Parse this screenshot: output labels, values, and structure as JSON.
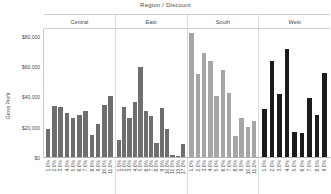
{
  "chart_data": {
    "type": "bar",
    "title": "Region / Discount",
    "xlabel": "",
    "ylabel": "Gross Profit",
    "ylim": [
      0,
      85000
    ],
    "grid": false,
    "legend": "none",
    "y_ticks": [
      "$0",
      "$20,000",
      "$40,000",
      "$60,000",
      "$80,000"
    ],
    "y_tick_values": [
      0,
      20000,
      40000,
      60000,
      80000
    ],
    "panel_label": "Region",
    "category_label": "Discount",
    "panels": [
      {
        "name": "Central",
        "color": "#6e6e6e",
        "categories": [
          "1.0%",
          "2.0%",
          "3.0%",
          "4.0%",
          "5.0%",
          "6.0%",
          "7.0%",
          "8.0%",
          "9.0%",
          "10.0%",
          "11.0%"
        ],
        "values": [
          18500,
          33500,
          33000,
          29000,
          25500,
          27500,
          30000,
          14500,
          22000,
          34500,
          40500
        ]
      },
      {
        "name": "East",
        "color": "#6e6e6e",
        "categories": [
          "1.0%",
          "2.0%",
          "3.0%",
          "4.0%",
          "5.0%",
          "6.0%",
          "7.0%",
          "8.0%",
          "9.0%",
          "10.0%",
          "11.0%",
          "15.0%",
          "17.0%"
        ],
        "values": [
          11500,
          33000,
          26000,
          36500,
          59500,
          30500,
          27000,
          9500,
          32000,
          18500,
          1200,
          900,
          8500
        ]
      },
      {
        "name": "South",
        "color": "#a6a6a6",
        "categories": [
          "1.0%",
          "2.0%",
          "3.0%",
          "4.0%",
          "5.0%",
          "6.0%",
          "7.0%",
          "8.0%",
          "9.0%",
          "10.0%",
          "11.0%"
        ],
        "values": [
          82000,
          54500,
          68500,
          63000,
          40000,
          57500,
          42500,
          14000,
          25500,
          19500,
          23500
        ]
      },
      {
        "name": "West",
        "color": "#1c1c1c",
        "categories": [
          "1.0%",
          "2.0%",
          "3.0%",
          "4.0%",
          "5.0%",
          "6.0%",
          "7.0%",
          "8.0%",
          "9.0%"
        ],
        "values": [
          31500,
          63500,
          41500,
          71500,
          16500,
          15500,
          39000,
          27500,
          55500
        ]
      }
    ]
  }
}
